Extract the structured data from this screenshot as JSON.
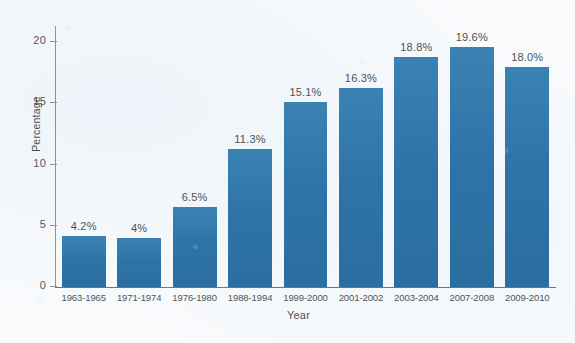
{
  "chart_data": {
    "type": "bar",
    "title": "",
    "xlabel": "Year",
    "ylabel": "Percentage",
    "ylim": [
      0,
      21
    ],
    "yticks": [
      "0",
      "5",
      "10",
      "15",
      "20"
    ],
    "ytick_values": [
      0,
      5,
      10,
      15,
      20
    ],
    "grid": false,
    "legend": "none",
    "bar_color": "#2f77aa",
    "background_color": "#f8fafc",
    "categories": [
      "1963-1965",
      "1971-1974",
      "1976-1980",
      "1988-1994",
      "1999-2000",
      "2001-2002",
      "2003-2004",
      "2007-2008",
      "2009-2010"
    ],
    "values": [
      4.2,
      4.0,
      6.5,
      11.3,
      15.1,
      16.3,
      18.8,
      19.6,
      18.0
    ],
    "data_labels": [
      "4.2%",
      "4%",
      "6.5%",
      "11.3%",
      "15.1%",
      "16.3%",
      "18.8%",
      "19.6%",
      "18.0%"
    ]
  }
}
